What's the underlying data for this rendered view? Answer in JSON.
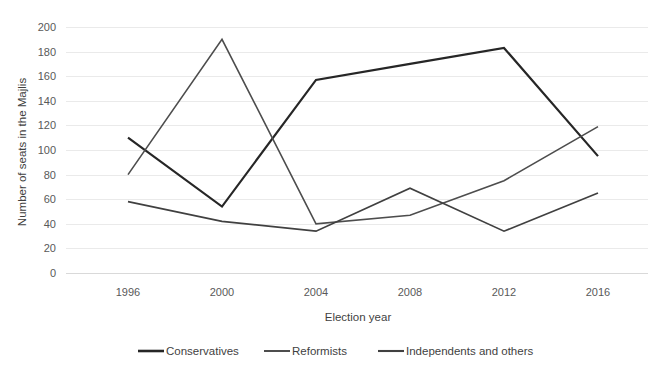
{
  "chart_data": {
    "type": "line",
    "title": "",
    "xlabel": "Election year",
    "ylabel": "Number of seats in the Majlis",
    "categories": [
      "1996",
      "2000",
      "2004",
      "2008",
      "2012",
      "2016"
    ],
    "x": [
      1996,
      2000,
      2004,
      2008,
      2012,
      2016
    ],
    "ylim": [
      0,
      200
    ],
    "ytick_step": 20,
    "yticks": [
      "200",
      "180",
      "160",
      "140",
      "120",
      "100",
      "80",
      "60",
      "40",
      "20",
      "0"
    ],
    "grid": "horizontal",
    "legend_position": "bottom",
    "series": [
      {
        "name": "Conservatives",
        "values": [
          110,
          54,
          157,
          170,
          183,
          95
        ],
        "color": "#262626",
        "width": 2.2
      },
      {
        "name": "Reformists",
        "values": [
          80,
          190,
          40,
          47,
          75,
          119
        ],
        "color": "#4d4d4d",
        "width": 1.6
      },
      {
        "name": "Independents and others",
        "values": [
          58,
          42,
          34,
          69,
          34,
          65
        ],
        "color": "#404040",
        "width": 1.7
      }
    ]
  },
  "axis": {
    "y_title": "Number of seats in the Majlis",
    "x_title": "Election year",
    "y_tick_0": "0",
    "y_tick_20": "20",
    "y_tick_40": "40",
    "y_tick_60": "60",
    "y_tick_80": "80",
    "y_tick_100": "100",
    "y_tick_120": "120",
    "y_tick_140": "140",
    "y_tick_160": "160",
    "y_tick_180": "180",
    "y_tick_200": "200",
    "x_tick_1": "1996",
    "x_tick_2": "2000",
    "x_tick_3": "2004",
    "x_tick_4": "2008",
    "x_tick_5": "2012",
    "x_tick_6": "2016"
  },
  "legend": {
    "item_1": "Conservatives",
    "item_2": "Reformists",
    "item_3": "Independents and others"
  },
  "colors": {
    "gridline": "#eaeaea",
    "baseline": "#d9d9d9",
    "text": "#3f3f3f",
    "tick_text": "#595959",
    "background": "#ffffff",
    "series_conservatives": "#262626",
    "series_reformists": "#4d4d4d",
    "series_independents": "#404040"
  }
}
